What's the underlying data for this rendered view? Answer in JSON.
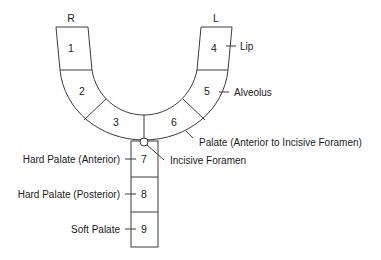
{
  "diagram": {
    "type": "palate-zone-map",
    "side_labels": {
      "right": "R",
      "left": "L"
    },
    "zones": [
      {
        "id": 1,
        "label": "1"
      },
      {
        "id": 2,
        "label": "2"
      },
      {
        "id": 3,
        "label": "3"
      },
      {
        "id": 4,
        "label": "4"
      },
      {
        "id": 5,
        "label": "5"
      },
      {
        "id": 6,
        "label": "6"
      },
      {
        "id": 7,
        "label": "7"
      },
      {
        "id": 8,
        "label": "8"
      },
      {
        "id": 9,
        "label": "9"
      }
    ],
    "annotations": {
      "lip": "Lip",
      "alveolus": "Alveolus",
      "palate_anterior": "Palate (Anterior to Incisive Foramen)",
      "incisive_foramen": "Incisive Foramen",
      "hard_palate_anterior": "Hard Palate (Anterior)",
      "hard_palate_posterior": "Hard Palate (Posterior)",
      "soft_palate": "Soft Palate"
    },
    "colors": {
      "stroke": "#3a3a3a",
      "text": "#1a1a1a",
      "background": "#ffffff"
    }
  }
}
